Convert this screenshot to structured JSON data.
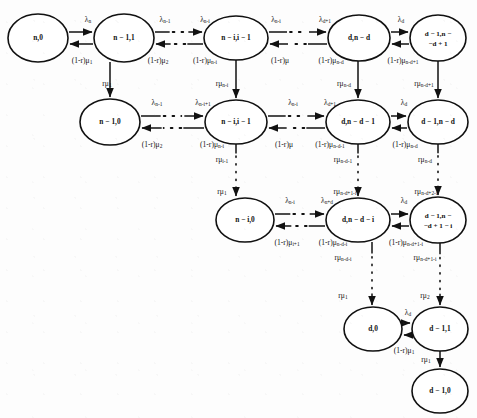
{
  "figure": {
    "kind": "markov-chain-state-transition-diagram",
    "width": 477,
    "height": 418,
    "stroke_color": "#111111",
    "node_fill": "#ffffff",
    "background": "#fdfdfd"
  },
  "nodes": [
    {
      "id": "n0",
      "label": "n,0",
      "line1": "n,0",
      "line2": "",
      "cx": 38,
      "cy": 38,
      "rx": 30,
      "ry": 24
    },
    {
      "id": "n1_1",
      "label": "n-1,1",
      "line1": "n − 1,1",
      "line2": "",
      "cx": 124,
      "cy": 38,
      "rx": 30,
      "ry": 24
    },
    {
      "id": "ni_im1",
      "label": "n-i,i-1",
      "line1": "n − i,i − 1",
      "line2": "",
      "cx": 236,
      "cy": 38,
      "rx": 32,
      "ry": 22
    },
    {
      "id": "d_nd",
      "label": "d,n-d",
      "line1": "d,n − d",
      "line2": "",
      "cx": 359,
      "cy": 38,
      "rx": 31,
      "ry": 23
    },
    {
      "id": "dm1_ndp1",
      "label": "d-1,n-d+1",
      "line1": "d − 1,n −",
      "line2": "−d + 1",
      "cx": 438,
      "cy": 38,
      "rx": 28,
      "ry": 23
    },
    {
      "id": "n1_0",
      "label": "n-1,0",
      "line1": "n − 1,0",
      "line2": "",
      "cx": 110,
      "cy": 122,
      "rx": 30,
      "ry": 23
    },
    {
      "id": "ni_i_1",
      "label": "n-i,i-1",
      "line1": "n − i,i − 1",
      "line2": "",
      "cx": 236,
      "cy": 122,
      "rx": 31,
      "ry": 22
    },
    {
      "id": "d_ndm1",
      "label": "d,n-d-1",
      "line1": "d,n − d − 1",
      "line2": "",
      "cx": 358,
      "cy": 122,
      "rx": 32,
      "ry": 22
    },
    {
      "id": "dm1_nd",
      "label": "d-1,n-d",
      "line1": "d − 1,n − d",
      "line2": "",
      "cx": 438,
      "cy": 122,
      "rx": 30,
      "ry": 22
    },
    {
      "id": "ni_0",
      "label": "n-i,0",
      "line1": "n − i,0",
      "line2": "",
      "cx": 245,
      "cy": 220,
      "rx": 29,
      "ry": 22
    },
    {
      "id": "d_ndmi",
      "label": "d,n-d-i",
      "line1": "d,n − d − i",
      "line2": "",
      "cx": 358,
      "cy": 220,
      "rx": 32,
      "ry": 22
    },
    {
      "id": "dm1_ndp1mi",
      "label": "d-1,n-d+1-i",
      "line1": "d − 1,n −",
      "line2": "−d + 1 − i",
      "cx": 438,
      "cy": 220,
      "rx": 28,
      "ry": 23
    },
    {
      "id": "d_0",
      "label": "d,0",
      "line1": "d,0",
      "line2": "",
      "cx": 373,
      "cy": 329,
      "rx": 29,
      "ry": 22
    },
    {
      "id": "dm1_1",
      "label": "d-1,1",
      "line1": "d − 1,1",
      "line2": "",
      "cx": 440,
      "cy": 329,
      "rx": 28,
      "ry": 22
    },
    {
      "id": "dm1_0",
      "label": "d-1,0",
      "line1": "d − 1,0",
      "line2": "",
      "cx": 440,
      "cy": 391,
      "rx": 28,
      "ry": 22
    }
  ],
  "edge_labels": {
    "row1": {
      "fwd": [
        {
          "base": "λ",
          "sub": "n",
          "x": 88,
          "y": 20
        },
        {
          "base": "λ",
          "sub": "n-1",
          "x": 165,
          "y": 20
        },
        {
          "base": "λ",
          "sub": "n-i",
          "x": 205,
          "y": 20
        },
        {
          "base": "λ",
          "sub": "n-i",
          "x": 276,
          "y": 20
        },
        {
          "base": "λ",
          "sub": "d+1",
          "x": 325,
          "y": 20
        },
        {
          "base": "λ",
          "sub": "d",
          "x": 401,
          "y": 20
        }
      ],
      "bwd": [
        {
          "base": "(1-r)μ",
          "sub": "1",
          "x": 82,
          "y": 61
        },
        {
          "base": "(1-r)μ",
          "sub": "2",
          "x": 158,
          "y": 61
        },
        {
          "base": "(1-r)μ",
          "sub": "n-i",
          "x": 205,
          "y": 61
        },
        {
          "base": "(1-r)μ",
          "sub": "",
          "x": 280,
          "y": 61
        },
        {
          "base": "(1-r)μ",
          "sub": "n-d",
          "x": 331,
          "y": 61
        },
        {
          "base": "(1-r)μ",
          "sub": "n-d+1",
          "x": 403,
          "y": 61
        }
      ]
    },
    "row2": {
      "fwd": [
        {
          "base": "λ",
          "sub": "n-1",
          "x": 157,
          "y": 103
        },
        {
          "base": "λ",
          "sub": "n-i+1",
          "x": 203,
          "y": 103
        },
        {
          "base": "λ",
          "sub": "n-i",
          "x": 293,
          "y": 103
        },
        {
          "base": "λ",
          "sub": "d+1",
          "x": 330,
          "y": 103
        },
        {
          "base": "λ",
          "sub": "d",
          "x": 404,
          "y": 103
        }
      ],
      "bwd": [
        {
          "base": "(1-r)μ",
          "sub": "2",
          "x": 152,
          "y": 145
        },
        {
          "base": "(1-r)μ",
          "sub": "n-i",
          "x": 212,
          "y": 145
        },
        {
          "base": "(1-r)μ",
          "sub": "",
          "x": 284,
          "y": 145
        },
        {
          "base": "(1-r)μ",
          "sub": "n-d-1",
          "x": 330,
          "y": 145
        },
        {
          "base": "(1-r)μ",
          "sub": "n-d",
          "x": 405,
          "y": 145
        }
      ]
    },
    "row3": {
      "fwd": [
        {
          "base": "λ",
          "sub": "n-i",
          "x": 290,
          "y": 201
        },
        {
          "base": "λ",
          "sub": "n+d",
          "x": 327,
          "y": 201
        },
        {
          "base": "λ",
          "sub": "d",
          "x": 404,
          "y": 201
        }
      ],
      "bwd": [
        {
          "base": "(1-r)μ",
          "sub": "i+1",
          "x": 287,
          "y": 243
        },
        {
          "base": "(1-r)μ",
          "sub": "n-d-i",
          "x": 333,
          "y": 243
        },
        {
          "base": "(1-r)μ",
          "sub": "n-d+1-i",
          "x": 406,
          "y": 243
        }
      ]
    },
    "row4": {
      "fwd": [
        {
          "base": "λ",
          "sub": "d",
          "x": 408,
          "y": 313
        }
      ],
      "bwd": [
        {
          "base": "(1-r)μ",
          "sub": "1",
          "x": 404,
          "y": 351
        }
      ]
    },
    "vertical": [
      {
        "base": "rμ",
        "sub": "1",
        "x": 107,
        "y": 84
      },
      {
        "base": "rμ",
        "sub": "n-i",
        "x": 222,
        "y": 84
      },
      {
        "base": "rμ",
        "sub": "n-d",
        "x": 344,
        "y": 84
      },
      {
        "base": "rμ",
        "sub": "n-d+1",
        "x": 424,
        "y": 84
      },
      {
        "base": "rμ",
        "sub": "i-1",
        "x": 222,
        "y": 160
      },
      {
        "base": "rμ",
        "sub": "1",
        "x": 222,
        "y": 192
      },
      {
        "base": "rμ",
        "sub": "n-d-1",
        "x": 343,
        "y": 160
      },
      {
        "base": "rμ",
        "sub": "n-d+1-i",
        "x": 345,
        "y": 192
      },
      {
        "base": "rμ",
        "sub": "n-d",
        "x": 425,
        "y": 160
      },
      {
        "base": "rμ",
        "sub": "n-d+2-i",
        "x": 426,
        "y": 192
      },
      {
        "base": "rμ",
        "sub": "n-d-i",
        "x": 343,
        "y": 258
      },
      {
        "base": "rμ",
        "sub": "1",
        "x": 343,
        "y": 296
      },
      {
        "base": "rμ",
        "sub": "n-d+1-i",
        "x": 425,
        "y": 258
      },
      {
        "base": "rμ",
        "sub": "2",
        "x": 425,
        "y": 296
      },
      {
        "base": "rμ",
        "sub": "1",
        "x": 426,
        "y": 360
      }
    ]
  },
  "legend": {
    "symbols": [
      {
        "glyph": "λ",
        "meaning": "arrival-rate"
      },
      {
        "glyph": "μ",
        "meaning": "service-rate"
      },
      {
        "glyph": "r",
        "meaning": "routing-probability"
      },
      {
        "glyph": "n",
        "meaning": "total-servers"
      },
      {
        "glyph": "d",
        "meaning": "threshold"
      },
      {
        "glyph": "i",
        "meaning": "index"
      }
    ]
  }
}
